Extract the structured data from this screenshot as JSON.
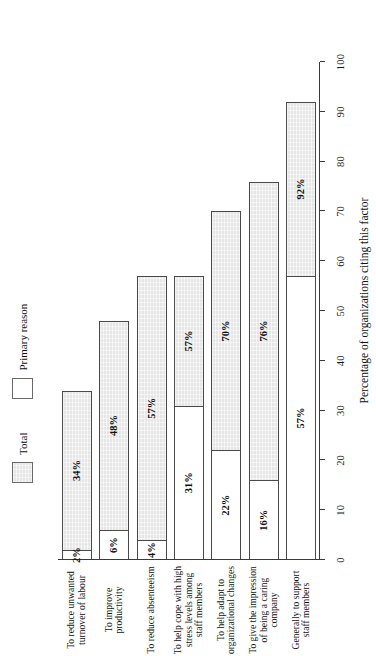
{
  "chart_data": {
    "type": "bar",
    "orientation": "horizontal",
    "title": "",
    "xlabel": "Percentage of organizations citing this factor",
    "ylabel": "",
    "xlim": [
      0,
      100
    ],
    "grid": false,
    "legend_position": "top",
    "tick_labels": [
      "0",
      "10",
      "20",
      "30",
      "40",
      "50",
      "60",
      "70",
      "80",
      "90",
      "100"
    ],
    "ticks": [
      0,
      10,
      20,
      30,
      40,
      50,
      60,
      70,
      80,
      90,
      100
    ],
    "categories": [
      "Generally to support staff members",
      "To give the impression of being a caring company",
      "To help adapt to organizational changes",
      "To help cope with high stress levels among staff members",
      "To reduce absenteeism",
      "To improve productivity",
      "To reduce unwanted turnover of labour"
    ],
    "series": [
      {
        "name": "Total",
        "values": [
          92,
          76,
          70,
          57,
          57,
          48,
          34
        ],
        "labels": [
          "92%",
          "76%",
          "70%",
          "57%",
          "57%",
          "48%",
          "34%"
        ],
        "color": "#e6e6e6"
      },
      {
        "name": "Primary reason",
        "values": [
          57,
          16,
          22,
          31,
          4,
          6,
          2
        ],
        "labels": [
          "57%",
          "16%",
          "22%",
          "31%",
          "4%",
          "6%",
          "2%"
        ],
        "color": "#ffffff"
      }
    ]
  },
  "legend": {
    "items": [
      {
        "label": "Total",
        "swatch": "total"
      },
      {
        "label": "Primary reason",
        "swatch": "primary"
      }
    ]
  },
  "axis": {
    "value_axis_title": "Percentage of organizations citing this factor"
  }
}
